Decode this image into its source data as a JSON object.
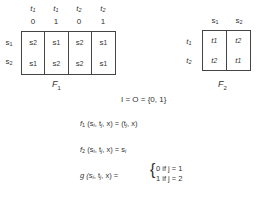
{
  "f1_table": {
    "name": "F",
    "subscript": "1",
    "column_headers": [
      {
        "t": "t",
        "t_sub": "1",
        "x": "0"
      },
      {
        "t": "t",
        "t_sub": "1",
        "x": "1"
      },
      {
        "t": "t",
        "t_sub": "2",
        "x": "0"
      },
      {
        "t": "t",
        "t_sub": "2",
        "x": "1"
      }
    ],
    "row_headers": [
      {
        "s": "s",
        "sub": "1"
      },
      {
        "s": "s",
        "sub": "2"
      }
    ],
    "columns": [
      [
        {
          "v": "s",
          "sub": "2"
        },
        {
          "v": "s",
          "sub": "1"
        }
      ],
      [
        {
          "v": "s",
          "sub": "1"
        },
        {
          "v": "s",
          "sub": "2"
        }
      ],
      [
        {
          "v": "s",
          "sub": "2"
        },
        {
          "v": "s",
          "sub": "2"
        }
      ],
      [
        {
          "v": "s",
          "sub": "1"
        },
        {
          "v": "s",
          "sub": "1"
        }
      ]
    ]
  },
  "f2_table": {
    "name": "F",
    "subscript": "2",
    "column_headers": [
      {
        "s": "s",
        "sub": "1"
      },
      {
        "s": "s",
        "sub": "2"
      }
    ],
    "row_headers": [
      {
        "t": "t",
        "sub": "1"
      },
      {
        "t": "t",
        "sub": "2"
      }
    ],
    "columns": [
      [
        {
          "v": "t",
          "sub": "1"
        },
        {
          "v": "t",
          "sub": "2"
        }
      ],
      [
        {
          "v": "t",
          "sub": "2"
        },
        {
          "v": "t",
          "sub": "1"
        }
      ]
    ]
  },
  "equations": {
    "io": "I = O = {0, 1}",
    "f1": {
      "lhs": "f",
      "lhs_sub": "1",
      "args": "(s",
      "a1": "i",
      "a2": ", t",
      "a3": "j",
      "a4": ", x) = (t",
      "a5": "j",
      "a6": ", x)"
    },
    "f2": {
      "lhs": "f",
      "lhs_sub": "2",
      "args": "(s",
      "a1": "i",
      "a2": ", t",
      "a3": "j",
      "a4": ", x) = s",
      "a5": "i"
    },
    "g": {
      "lhs": "g (s",
      "a1": "i",
      "a2": ", t",
      "a3": "j",
      "a4": ", x) =",
      "case1": "0  if  j = 1",
      "case2": "1  if  j = 2"
    }
  }
}
